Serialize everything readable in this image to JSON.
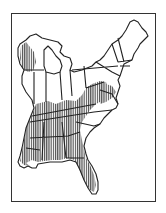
{
  "map": {
    "title": "",
    "region": "Eastern United States",
    "frame": true,
    "colors": {
      "background": "#ffffff",
      "outline": "#222222",
      "hatch": "#333333"
    },
    "legend": [],
    "hatched_range": {
      "pattern": "vertical-lines",
      "regions": [
        "northwest-wisconsin",
        "southern-illinois",
        "southern-indiana",
        "kentucky",
        "tennessee",
        "west-virginia",
        "western-virginia",
        "western-maryland",
        "southern-pennsylvania",
        "mississippi",
        "alabama",
        "western-georgia",
        "louisiana-east",
        "florida-panhandle-and-peninsula"
      ]
    }
  }
}
